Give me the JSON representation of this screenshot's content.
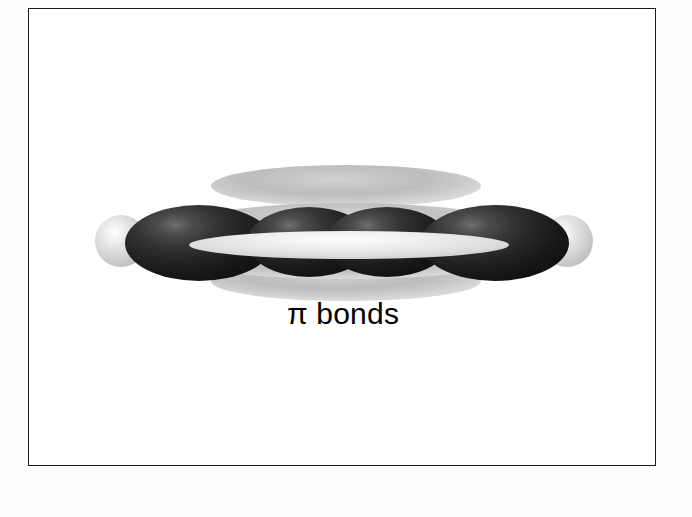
{
  "figure": {
    "caption": "π bonds",
    "background_color": "#ffffff",
    "border_color": "#1a1a1a",
    "colors": {
      "sigma_lobe_dark": "#1b1b1b",
      "sigma_lobe_highlight": "#6e6e6e",
      "pi_lobe_gray": "#c6c6c6",
      "hydrogen_sphere": "#d2d2d2",
      "hydrogen_highlight": "#ffffff",
      "sigma_lens": "#eeeeee",
      "caption_text": "#000000"
    },
    "bond_axis_y": 230,
    "parts": [
      {
        "id": "pi-lobe-top",
        "label": "upper pi lobe",
        "kind": "pi-lobe",
        "x": 182,
        "y": 156,
        "w": 270,
        "h": 42,
        "fill": "#c6c6c6"
      },
      {
        "id": "pi-lobe-bottom",
        "label": "lower pi lobe",
        "kind": "pi-lobe",
        "x": 182,
        "y": 252,
        "w": 270,
        "h": 40,
        "fill": "#c6c6c6"
      },
      {
        "id": "pi-lobe-mid-upper",
        "label": "inner upper pi lobe",
        "kind": "pi-lobe",
        "x": 168,
        "y": 194,
        "w": 300,
        "h": 38,
        "fill": "#cdcdcd"
      },
      {
        "id": "pi-lobe-mid-lower",
        "label": "inner lower pi lobe",
        "kind": "pi-lobe",
        "x": 168,
        "y": 236,
        "w": 300,
        "h": 34,
        "fill": "#cdcdcd"
      },
      {
        "id": "h-sphere-left",
        "label": "left hydrogen sphere",
        "kind": "hydrogen",
        "x": 66,
        "y": 206,
        "w": 52,
        "h": 52,
        "fill": "#d2d2d2"
      },
      {
        "id": "h-sphere-right",
        "label": "right hydrogen sphere",
        "kind": "hydrogen",
        "x": 512,
        "y": 206,
        "w": 52,
        "h": 52,
        "fill": "#d2d2d2"
      },
      {
        "id": "sigma-lobe-1",
        "label": "outer left sigma lobe",
        "kind": "sigma",
        "x": 96,
        "y": 196,
        "w": 148,
        "h": 76,
        "fill": "#1b1b1b"
      },
      {
        "id": "sigma-lobe-2",
        "label": "inner left sigma lobe",
        "kind": "sigma",
        "x": 218,
        "y": 198,
        "w": 124,
        "h": 70,
        "fill": "#1b1b1b"
      },
      {
        "id": "sigma-lobe-3",
        "label": "inner right sigma lobe",
        "kind": "sigma",
        "x": 296,
        "y": 198,
        "w": 124,
        "h": 70,
        "fill": "#1b1b1b"
      },
      {
        "id": "sigma-lobe-4",
        "label": "outer right sigma lobe",
        "kind": "sigma",
        "x": 392,
        "y": 196,
        "w": 148,
        "h": 76,
        "fill": "#1b1b1b"
      },
      {
        "id": "sigma-lens",
        "label": "central sigma bond lens",
        "kind": "lens",
        "x": 160,
        "y": 222,
        "w": 320,
        "h": 28,
        "fill": "#eeeeee"
      }
    ],
    "caption_position": {
      "y": 288,
      "font_size": 30
    }
  }
}
